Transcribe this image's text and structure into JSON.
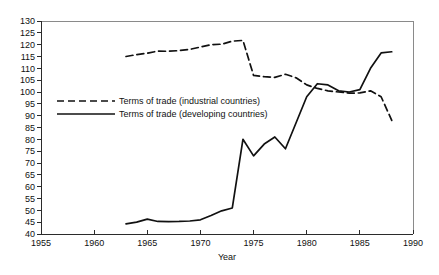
{
  "chart_data": {
    "type": "line",
    "title": "",
    "xlabel": "Year",
    "ylabel": "",
    "xlim": [
      1955,
      1990
    ],
    "ylim": [
      40,
      130
    ],
    "grid": false,
    "legend_position": "inside-upper-left",
    "x_ticks": [
      "1955",
      "1960",
      "1965",
      "1970",
      "1975",
      "1980",
      "1985",
      "1990"
    ],
    "x_tick_values": [
      1955,
      1960,
      1965,
      1970,
      1975,
      1980,
      1985,
      1990
    ],
    "y_ticks": [
      "40",
      "45",
      "50",
      "55",
      "60",
      "65",
      "70",
      "75",
      "80",
      "85",
      "90",
      "95",
      "100",
      "105",
      "110",
      "115",
      "120",
      "125",
      "130"
    ],
    "y_tick_values": [
      40,
      45,
      50,
      55,
      60,
      65,
      70,
      75,
      80,
      85,
      90,
      95,
      100,
      105,
      110,
      115,
      120,
      125,
      130
    ],
    "series": [
      {
        "name": "Terms of trade (industrial countries)",
        "style": "dashed",
        "color": "#111111",
        "x": [
          1963,
          1964,
          1965,
          1966,
          1967,
          1968,
          1969,
          1970,
          1971,
          1972,
          1973,
          1974,
          1975,
          1976,
          1977,
          1978,
          1979,
          1980,
          1981,
          1982,
          1983,
          1984,
          1985,
          1986,
          1987,
          1988
        ],
        "values": [
          115.0,
          115.8,
          116.4,
          117.3,
          117.2,
          117.5,
          118.0,
          119.0,
          120.0,
          120.2,
          121.5,
          121.8,
          107.0,
          106.5,
          106.2,
          107.5,
          106.0,
          103.0,
          101.5,
          100.5,
          100.0,
          99.5,
          99.6,
          100.5,
          98.0,
          88.0
        ]
      },
      {
        "name": "Terms of trade (developing countries)",
        "style": "solid",
        "color": "#111111",
        "x": [
          1963,
          1964,
          1965,
          1966,
          1967,
          1968,
          1969,
          1970,
          1971,
          1972,
          1973,
          1974,
          1975,
          1976,
          1977,
          1978,
          1979,
          1980,
          1981,
          1982,
          1983,
          1984,
          1985,
          1986,
          1987,
          1988
        ],
        "values": [
          44.3,
          45.0,
          46.3,
          45.3,
          45.2,
          45.3,
          45.5,
          46.0,
          47.8,
          49.8,
          51.0,
          80.0,
          73.0,
          78.0,
          81.0,
          76.0,
          87.0,
          98.0,
          103.5,
          103.0,
          100.5,
          100.0,
          101.0,
          110.0,
          116.5,
          117.0
        ]
      }
    ]
  },
  "legend": {
    "items": [
      {
        "label": "Terms of trade (industrial countries)",
        "style": "dashed"
      },
      {
        "label": "Terms of trade (developing countries)",
        "style": "solid"
      }
    ]
  }
}
